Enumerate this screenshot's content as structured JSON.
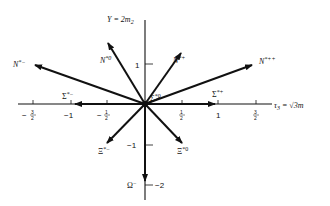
{
  "diagram": {
    "axes": {
      "vertical_label": "Y = 2m",
      "vertical_label_sub": "2",
      "horizontal_label": "τ",
      "horizontal_label_sub": "3",
      "horizontal_label_rest": " = √3m",
      "horizontal_ticks": [
        {
          "num": "3",
          "den": "2",
          "sign": "−",
          "x": 33
        },
        {
          "text": "−1",
          "x": 71
        },
        {
          "num": "1",
          "den": "2",
          "sign": "−",
          "x": 107
        },
        {
          "num": "1",
          "den": "2",
          "sign": "",
          "x": 182
        },
        {
          "text": "1",
          "x": 218
        },
        {
          "num": "3",
          "den": "2",
          "sign": "",
          "x": 256
        }
      ],
      "vertical_ticks": [
        {
          "text": "1",
          "y": 64
        },
        {
          "text": "−1",
          "y": 145
        },
        {
          "text": "−2",
          "y": 185
        }
      ]
    },
    "states": [
      {
        "name": "N*−",
        "base": "N",
        "sup": "*−",
        "tip": [
          35,
          65
        ]
      },
      {
        "name": "N*0",
        "base": "N",
        "sup": "*0",
        "tip": [
          108,
          43
        ]
      },
      {
        "name": "N*+",
        "base": "N",
        "sup": "*+",
        "tip": [
          181,
          53
        ]
      },
      {
        "name": "N*++",
        "base": "N",
        "sup": "*++",
        "tip": [
          252,
          65
        ]
      },
      {
        "name": "Σ*−",
        "base": "Σ",
        "sup": "*−",
        "tip": [
          75,
          103
        ]
      },
      {
        "name": "Σ*0",
        "base": "Σ",
        "sup": "*0",
        "tip": [
          160,
          98
        ]
      },
      {
        "name": "Σ*+",
        "base": "Σ",
        "sup": "*+",
        "tip": [
          215,
          103
        ]
      },
      {
        "name": "Ξ*−",
        "base": "Ξ",
        "sup": "*−",
        "tip": [
          107,
          143
        ]
      },
      {
        "name": "Ξ*0",
        "base": "Ξ",
        "sup": "*0",
        "tip": [
          182,
          143
        ]
      },
      {
        "name": "Ω−",
        "base": "Ω",
        "sup": "−",
        "tip": [
          145,
          181
        ]
      }
    ],
    "labels": {
      "n_minus_base": "N",
      "n_minus_sup": "*−",
      "n_zero_base": "N",
      "n_zero_sup": "*0",
      "n_plus_base": "N",
      "n_plus_sup": "*+",
      "n_plusplus_base": "N",
      "n_plusplus_sup": "*++",
      "sigma_minus_base": "Σ",
      "sigma_minus_sup": "*−",
      "sigma_zero_base": "Σ",
      "sigma_zero_sup": "*0",
      "sigma_plus_base": "Σ",
      "sigma_plus_sup": "*+",
      "xi_minus_base": "Ξ",
      "xi_minus_sup": "*−",
      "xi_zero_base": "Ξ",
      "xi_zero_sup": "*0",
      "omega_base": "Ω",
      "omega_sup": "−"
    },
    "tick_text": {
      "h_m3_2_sign": "−",
      "h_m3_2_num": "3",
      "h_m3_2_den": "2",
      "h_m1": "−1",
      "h_m1_2_sign": "−",
      "h_m1_2_num": "1",
      "h_m1_2_den": "2",
      "h_1_2_num": "1",
      "h_1_2_den": "2",
      "h_1": "1",
      "h_3_2_num": "3",
      "h_3_2_den": "2",
      "v_1": "1",
      "v_m1": "−1",
      "v_m2": "−2"
    },
    "colors": {
      "ink": "#111111",
      "background": "#ffffff"
    }
  }
}
